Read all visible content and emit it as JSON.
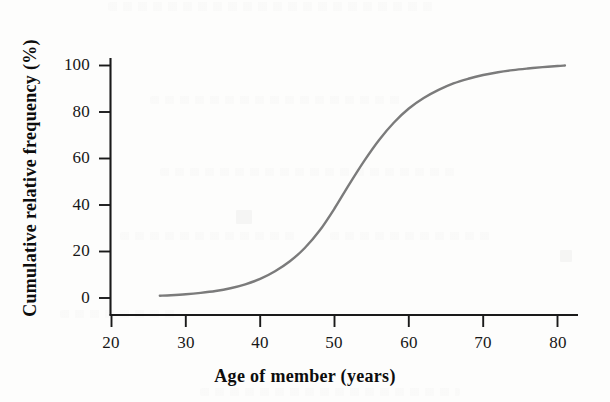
{
  "chart_data": {
    "type": "line",
    "title": "",
    "subtitle": "",
    "xlabel": "Age of member (years)",
    "ylabel": "Cumulative relative frequency (%)",
    "xlim": [
      18,
      84
    ],
    "ylim": [
      -6,
      108
    ],
    "xticks": [
      20,
      30,
      40,
      50,
      60,
      70,
      80
    ],
    "xtick_labels": [
      "20",
      "30",
      "40",
      "50",
      "60",
      "70",
      "80"
    ],
    "yticks": [
      0,
      20,
      40,
      60,
      80,
      100
    ],
    "ytick_labels": [
      "0",
      "20",
      "40",
      "60",
      "80",
      "100"
    ],
    "grid": false,
    "legend": null,
    "legend_position": "none",
    "series": [
      {
        "name": "Cumulative relative frequency",
        "color": "#7b7b7b",
        "line_width": 2.4,
        "markers": false,
        "x": [
          26.5,
          28,
          30,
          32,
          34,
          36,
          38,
          40,
          42,
          44,
          46,
          48,
          50,
          52,
          54,
          56,
          58,
          60,
          62,
          64,
          66,
          68,
          70,
          72,
          74,
          76,
          78,
          80,
          81
        ],
        "y": [
          1.0,
          1.2,
          1.6,
          2.2,
          3.0,
          4.2,
          5.9,
          8.2,
          11.5,
          15.8,
          21.5,
          29.0,
          38.5,
          49.0,
          59.0,
          68.0,
          75.5,
          81.5,
          86.0,
          89.5,
          92.3,
          94.3,
          95.9,
          97.1,
          98.0,
          98.7,
          99.3,
          99.8,
          100.0
        ]
      }
    ],
    "annotations": [],
    "axis_color": "#1a1a1a",
    "background_color": "#fdfdfc"
  },
  "axes": {
    "x_title": "Age of member (years)",
    "y_title": "Cumulative relative frequency (%)",
    "x_tick_labels": [
      "20",
      "30",
      "40",
      "50",
      "60",
      "70",
      "80"
    ],
    "y_tick_labels": [
      "0",
      "20",
      "40",
      "60",
      "80",
      "100"
    ]
  }
}
